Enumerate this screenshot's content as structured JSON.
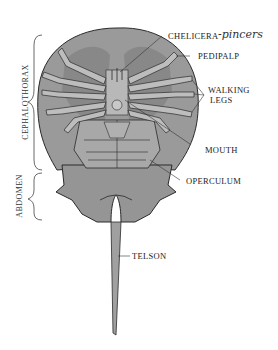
{
  "diagram": {
    "colors": {
      "body": "#9a9a9a",
      "shell_dark": "#7a7a7a",
      "outline": "#2a2a2a",
      "leg": "#b5b5b5",
      "text": "#222222"
    },
    "labels": {
      "chelicera": "CHELICERA",
      "chelicera_note": "-pincers",
      "pedipalp": "PEDIPALP",
      "walking_legs_1": "WALKING",
      "walking_legs_2": "LEGS",
      "mouth": "MOUTH",
      "operculum": "OPERCULUM",
      "telson": "TELSON",
      "cephalothorax": "CEPHALOTHORAX",
      "abdomen": "ABDOMEN"
    }
  }
}
